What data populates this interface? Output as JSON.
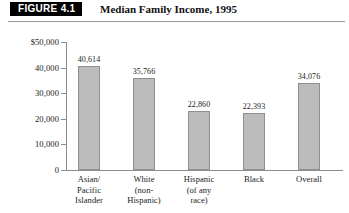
{
  "figure": {
    "badge": "FIGURE 4.1",
    "title": "Median Family Income, 1995"
  },
  "chart_data": {
    "type": "bar",
    "title": "Median Family Income, 1995",
    "xlabel": "",
    "ylabel": "",
    "ylim": [
      0,
      50000
    ],
    "grid": false,
    "legend": "none",
    "y_ticks": [
      0,
      10000,
      20000,
      30000,
      40000,
      50000
    ],
    "y_tick_labels": [
      "0",
      "10,000",
      "20,000",
      "30,000",
      "40,000",
      "$50,000"
    ],
    "categories": [
      "Asian/\nPacific\nIslander",
      "White\n(non-\nHispanic)",
      "Hispanic\n(of any\nrace)",
      "Black",
      "Overall"
    ],
    "category_lines": [
      [
        "Asian/",
        "Pacific",
        "Islander"
      ],
      [
        "White",
        "(non-",
        "Hispanic)"
      ],
      [
        "Hispanic",
        "(of any",
        "race)"
      ],
      [
        "Black"
      ],
      [
        "Overall"
      ]
    ],
    "values": [
      40614,
      35766,
      22860,
      22393,
      34076
    ],
    "value_labels": [
      "40,614",
      "35,766",
      "22,860",
      "22,393",
      "34,076"
    ],
    "bar_color": "#bcbcbc",
    "bar_border_color": "#8f8f8f",
    "axis_color": "#8d8d8d"
  }
}
